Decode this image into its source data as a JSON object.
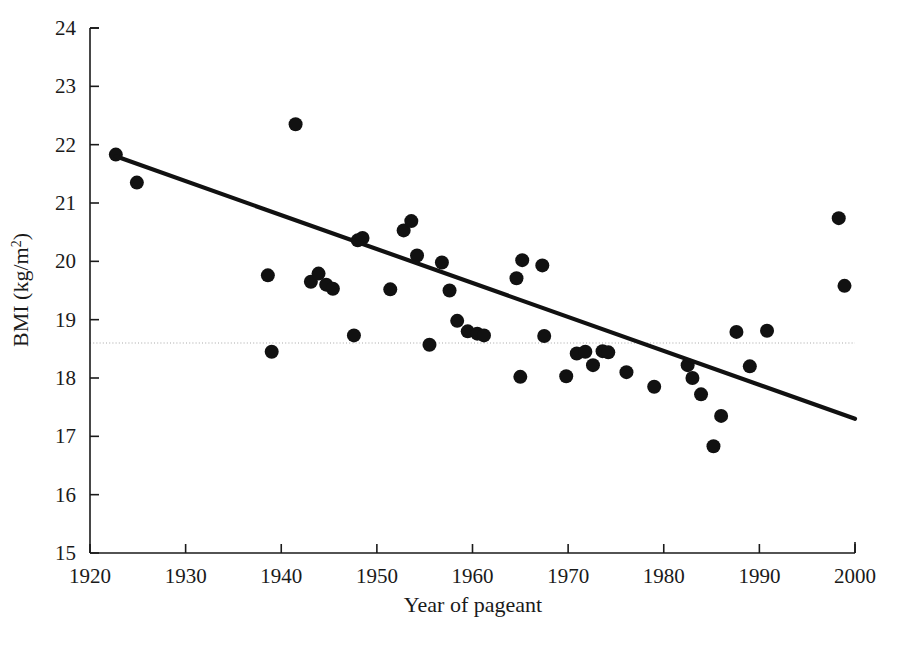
{
  "chart_data": {
    "type": "scatter",
    "title": "",
    "xlabel": "Year of pageant",
    "ylabel": "BMI (kg/m²)",
    "xlim": [
      1920,
      2000
    ],
    "ylim": [
      15,
      24
    ],
    "xticks": [
      1920,
      1930,
      1940,
      1950,
      1960,
      1970,
      1980,
      1990,
      2000
    ],
    "yticks": [
      15,
      16,
      17,
      18,
      19,
      20,
      21,
      22,
      23,
      24
    ],
    "grid": false,
    "legend": "none",
    "series": [
      {
        "name": "Miss America BMI",
        "marker": "filled-circle",
        "color": "#111111",
        "points": [
          [
            1922.7,
            21.83
          ],
          [
            1924.9,
            21.35
          ],
          [
            1938.6,
            19.76
          ],
          [
            1939.0,
            18.45
          ],
          [
            1941.5,
            22.35
          ],
          [
            1943.1,
            19.65
          ],
          [
            1943.9,
            19.79
          ],
          [
            1944.7,
            19.6
          ],
          [
            1945.4,
            19.53
          ],
          [
            1947.6,
            18.73
          ],
          [
            1948.0,
            20.36
          ],
          [
            1948.5,
            20.4
          ],
          [
            1951.4,
            19.52
          ],
          [
            1952.8,
            20.53
          ],
          [
            1953.6,
            20.69
          ],
          [
            1954.2,
            20.1
          ],
          [
            1955.5,
            18.57
          ],
          [
            1956.8,
            19.98
          ],
          [
            1957.6,
            19.5
          ],
          [
            1958.4,
            18.98
          ],
          [
            1959.5,
            18.8
          ],
          [
            1960.5,
            18.76
          ],
          [
            1961.2,
            18.73
          ],
          [
            1964.6,
            19.71
          ],
          [
            1965.2,
            20.02
          ],
          [
            1965.0,
            18.02
          ],
          [
            1967.3,
            19.93
          ],
          [
            1967.5,
            18.72
          ],
          [
            1969.8,
            18.03
          ],
          [
            1970.9,
            18.42
          ],
          [
            1971.8,
            18.45
          ],
          [
            1972.6,
            18.22
          ],
          [
            1973.6,
            18.46
          ],
          [
            1974.2,
            18.44
          ],
          [
            1976.1,
            18.1
          ],
          [
            1979.0,
            17.85
          ],
          [
            1982.5,
            18.22
          ],
          [
            1983.0,
            18.0
          ],
          [
            1983.9,
            17.72
          ],
          [
            1985.2,
            16.83
          ],
          [
            1986.0,
            17.35
          ],
          [
            1987.6,
            18.79
          ],
          [
            1989.0,
            18.2
          ],
          [
            1990.8,
            18.81
          ],
          [
            1998.3,
            20.74
          ],
          [
            1998.9,
            19.58
          ]
        ]
      }
    ],
    "trend_line": {
      "name": "linear regression fit",
      "color": "#111111",
      "x_start": 1922.7,
      "y_start": 21.8,
      "x_end": 2000.0,
      "y_end": 17.3
    },
    "reference_line": {
      "name": "underweight threshold",
      "orientation": "horizontal",
      "y": 18.6,
      "style": "dotted",
      "color": "#9a9a9a"
    }
  },
  "axis": {
    "x_tick_labels": [
      "1920",
      "1930",
      "1940",
      "1950",
      "1960",
      "1970",
      "1980",
      "1990",
      "2000"
    ],
    "y_tick_labels": [
      "15",
      "16",
      "17",
      "18",
      "19",
      "20",
      "21",
      "22",
      "23",
      "24"
    ],
    "x_title": "Year of pageant",
    "y_title_main": "BMI (kg/m",
    "y_title_sup": "2",
    "y_title_close": ")"
  }
}
